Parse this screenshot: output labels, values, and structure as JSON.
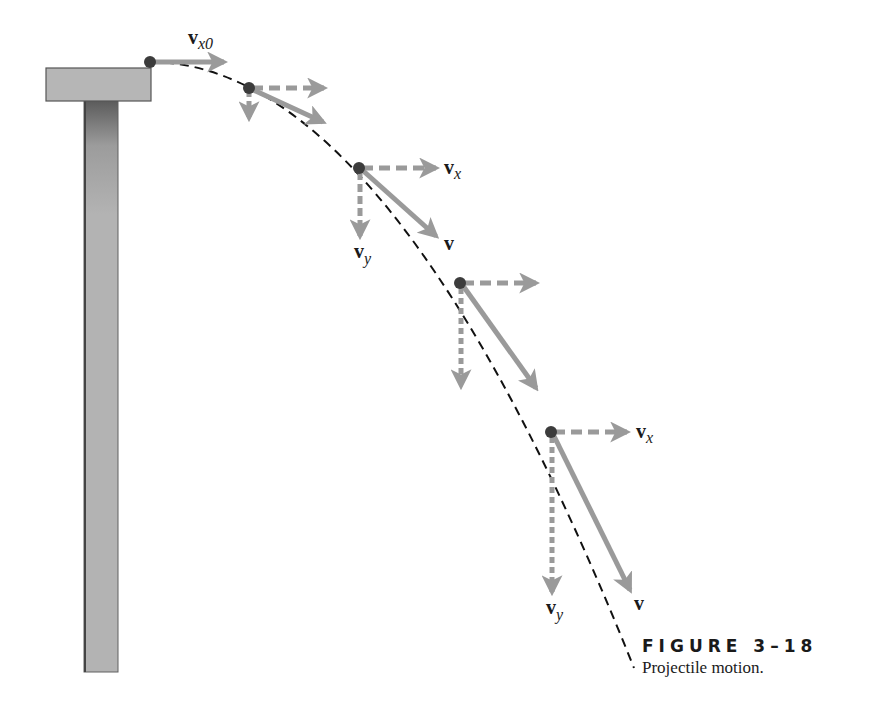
{
  "figure": {
    "number_label": "FIGURE 3–18",
    "caption": "Projectile motion."
  },
  "labels": {
    "vx0": {
      "main": "v",
      "sub": "x0"
    },
    "vx_1": {
      "main": "v",
      "sub": "x"
    },
    "vy_1": {
      "main": "v",
      "sub": "y"
    },
    "v_1": {
      "main": "v"
    },
    "vx_2": {
      "main": "v",
      "sub": "x"
    },
    "vy_2": {
      "main": "v",
      "sub": "y"
    },
    "v_2": {
      "main": "v"
    }
  },
  "colors": {
    "vector": "#9a9a9a",
    "trajectory": "#111111",
    "ball": "#3c3c3c",
    "cliff": "#b4b4b4",
    "cliff_edge": "#555555"
  },
  "trajectory_points": [
    {
      "x": 150,
      "y": 62
    },
    {
      "x": 249,
      "y": 88
    },
    {
      "x": 359,
      "y": 168
    },
    {
      "x": 460,
      "y": 283
    },
    {
      "x": 551,
      "y": 432
    }
  ]
}
